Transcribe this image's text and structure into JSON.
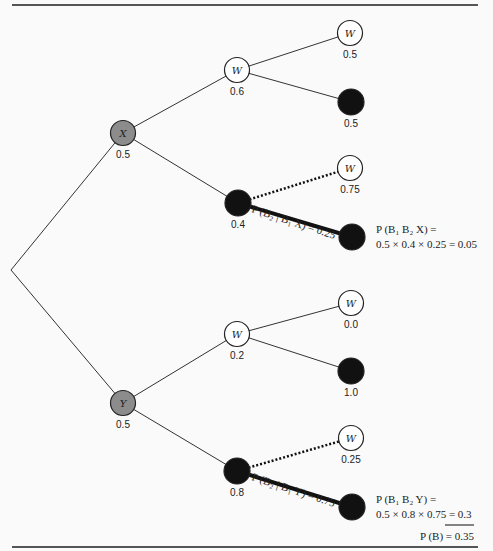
{
  "diagram": {
    "type": "probability-tree",
    "root": {
      "x": 11,
      "y": 270
    },
    "nodes": [
      {
        "id": "X",
        "label": "X",
        "prob": "0.5",
        "kind": "gray",
        "x": 123,
        "y": 133
      },
      {
        "id": "Y",
        "label": "Y",
        "prob": "0.5",
        "kind": "gray",
        "x": 123,
        "y": 403
      },
      {
        "id": "XW",
        "label": "W",
        "prob": "0.6",
        "kind": "white",
        "x": 237,
        "y": 70
      },
      {
        "id": "XB",
        "label": "",
        "prob": "0.4",
        "kind": "black",
        "x": 238,
        "y": 203
      },
      {
        "id": "YW",
        "label": "W",
        "prob": "0.2",
        "kind": "white",
        "x": 237,
        "y": 334
      },
      {
        "id": "YB",
        "label": "",
        "prob": "0.8",
        "kind": "black",
        "x": 237,
        "y": 471
      },
      {
        "id": "XWW",
        "label": "W",
        "prob": "0.5",
        "kind": "white",
        "x": 350,
        "y": 33
      },
      {
        "id": "XWB",
        "label": "",
        "prob": "0.5",
        "kind": "black",
        "x": 351,
        "y": 102
      },
      {
        "id": "XBW",
        "label": "W",
        "prob": "0.75",
        "kind": "white",
        "x": 350,
        "y": 168
      },
      {
        "id": "XBB",
        "label": "",
        "prob": "",
        "kind": "black",
        "x": 352,
        "y": 237
      },
      {
        "id": "YWW",
        "label": "W",
        "prob": "0.0",
        "kind": "white",
        "x": 351,
        "y": 303
      },
      {
        "id": "YWB",
        "label": "",
        "prob": "1.0",
        "kind": "black",
        "x": 351,
        "y": 371
      },
      {
        "id": "YBW",
        "label": "W",
        "prob": "0.25",
        "kind": "white",
        "x": 351,
        "y": 438
      },
      {
        "id": "YBB",
        "label": "",
        "prob": "",
        "kind": "black",
        "x": 352,
        "y": 507
      }
    ],
    "edges": [
      {
        "from": "root",
        "to": "X",
        "style": "solid"
      },
      {
        "from": "root",
        "to": "Y",
        "style": "solid"
      },
      {
        "from": "X",
        "to": "XW",
        "style": "solid"
      },
      {
        "from": "X",
        "to": "XB",
        "style": "solid"
      },
      {
        "from": "Y",
        "to": "YW",
        "style": "solid"
      },
      {
        "from": "Y",
        "to": "YB",
        "style": "solid"
      },
      {
        "from": "XW",
        "to": "XWW",
        "style": "solid"
      },
      {
        "from": "XW",
        "to": "XWB",
        "style": "solid"
      },
      {
        "from": "XB",
        "to": "XBW",
        "style": "dotted"
      },
      {
        "from": "XB",
        "to": "XBB",
        "style": "bold"
      },
      {
        "from": "YW",
        "to": "YWW",
        "style": "solid"
      },
      {
        "from": "YW",
        "to": "YWB",
        "style": "solid"
      },
      {
        "from": "YB",
        "to": "YBW",
        "style": "dotted"
      },
      {
        "from": "YB",
        "to": "YBB",
        "style": "bold"
      }
    ],
    "edge_labels": {
      "xb_bold": "P (B₂ | B₁ X) = 0.25",
      "yb_bold": "P (B₂ | B₁ Y) = 0.75"
    },
    "equations": {
      "x_line1": "P (B₁ B₂ X) =",
      "x_line2": "0.5 × 0.4 × 0.25 = 0.05",
      "y_line1": "P (B₁ B₂ Y) =",
      "y_line2": "0.5 × 0.8 × 0.75 = 0.3",
      "total": "P (B) = 0.35"
    },
    "colors": {
      "gray_node": "#8c8c8c",
      "black_node": "#111111",
      "white_node": "#ffffff",
      "line": "#333333",
      "rule": "#555555"
    }
  }
}
